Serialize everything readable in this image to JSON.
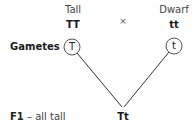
{
  "parents": {
    "left": {
      "phenotype": "Tall",
      "genotype": "TT",
      "gamete": "T"
    },
    "right": {
      "phenotype": "Dwarf",
      "genotype": "tt",
      "gamete": "t"
    },
    "cross_symbol": "×"
  },
  "labels": {
    "gametes": "Gametes",
    "f1_prefix": "F1",
    "f1_desc": " – all tall"
  },
  "offspring": {
    "genotype": "Tt"
  },
  "colors": {
    "line": "#333333",
    "circle": "#555555",
    "text": "#222222"
  }
}
